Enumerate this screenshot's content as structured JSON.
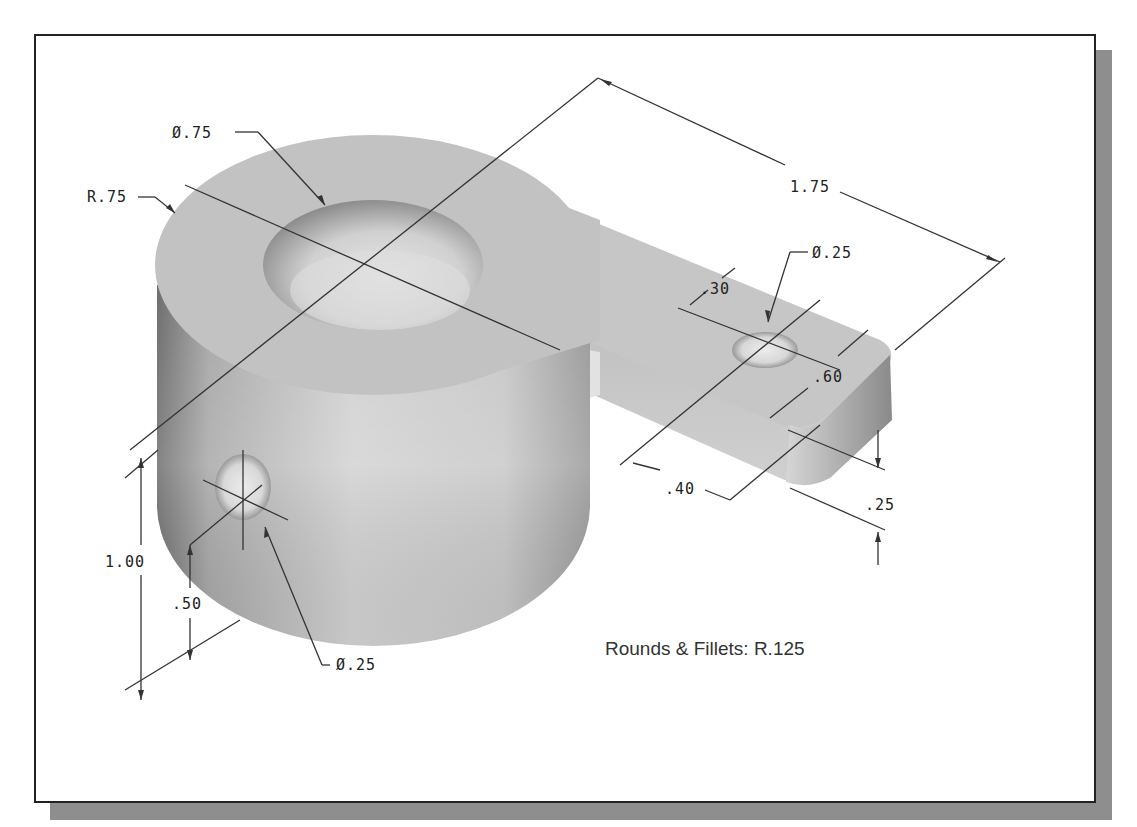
{
  "figure": {
    "note": "Rounds & Fillets: R.125",
    "dimensions": {
      "top_bore_diameter": "Ø.75",
      "boss_radius": "R.75",
      "overall_length": "1.75",
      "arm_hole_diameter": "Ø.25",
      "arm_hole_offset": ".30",
      "arm_width": ".60",
      "arm_hole_position": ".40",
      "arm_thickness": ".25",
      "overall_height": "1.00",
      "side_hole_height": ".50",
      "side_hole_diameter": "Ø.25"
    }
  },
  "colors": {
    "frame_border": "#222222",
    "shadow": "#8e8e8e",
    "part_surface": "#c4c4c4",
    "dimension_line": "#333333"
  }
}
